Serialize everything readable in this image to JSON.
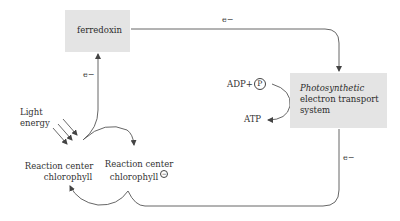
{
  "diagram": {
    "nodes": {
      "ferredoxin": {
        "label": "ferredoxin"
      },
      "pets": {
        "line1": "Photosynthetic",
        "line2": "electron transport",
        "line3": "system"
      },
      "rc_ground": {
        "line1": "Reaction center",
        "line2": "chlorophyll"
      },
      "rc_excited": {
        "line1": "Reaction center",
        "line2": "chlorophyll",
        "charge_symbol": "−"
      }
    },
    "labels": {
      "light_energy_line1": "Light",
      "light_energy_line2": "energy",
      "electron_rc_to_ferredoxin": "e−",
      "electron_ferredoxin_to_pets": "e−",
      "electron_pets_to_rc": "e−",
      "adp": "ADP+",
      "phosphate_symbol": "P",
      "atp": "ATP"
    },
    "colors": {
      "box_fill": "#e4e4e4",
      "line": "#444444",
      "text": "#333333"
    }
  }
}
